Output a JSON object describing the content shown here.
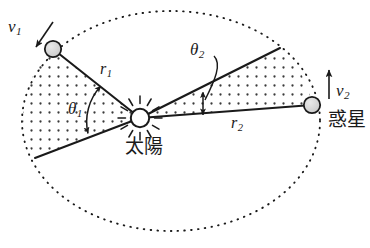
{
  "figure": {
    "background_color": "#ffffff",
    "ink_color": "#1a1a1a",
    "body_fill_color": "#d9d9d9",
    "stipple_color": "#333333"
  },
  "labels": {
    "v1": {
      "base": "v",
      "sub": "1"
    },
    "v2": {
      "base": "v",
      "sub": "2"
    },
    "r1": {
      "base": "r",
      "sub": "1"
    },
    "r2": {
      "base": "r",
      "sub": "2"
    },
    "theta1": {
      "base": "θ",
      "sub": "1"
    },
    "theta2": {
      "base": "θ",
      "sub": "2"
    },
    "sun": "太陽",
    "planet": "惑星"
  },
  "geometry": {
    "orbit": {
      "shape": "ellipse",
      "center_x": 171,
      "center_y": 121,
      "radius_x": 149,
      "radius_y": 110,
      "stroke": "dotted"
    },
    "sun": {
      "x": 140,
      "y": 118,
      "r": 9,
      "rays": 12
    },
    "planet_1": {
      "x": 53,
      "y": 49,
      "r": 8
    },
    "planet_2": {
      "x": 312,
      "y": 105,
      "r": 8
    },
    "sector_1": {
      "apex": [
        140,
        118
      ],
      "edge_a": [
        53,
        49
      ],
      "edge_b": [
        35,
        158
      ],
      "label": "θ₁ sector swept by r₁"
    },
    "sector_2": {
      "apex": [
        140,
        118
      ],
      "edge_a": [
        280,
        48
      ],
      "edge_b": [
        312,
        105
      ],
      "label": "θ₂ sector swept by r₂"
    },
    "velocity_arrow_1": {
      "from": [
        52,
        22
      ],
      "to": [
        36,
        47
      ],
      "direction": "down-left"
    },
    "velocity_arrow_2": {
      "from": [
        329,
        98
      ],
      "to": [
        329,
        70
      ],
      "direction": "up"
    }
  }
}
